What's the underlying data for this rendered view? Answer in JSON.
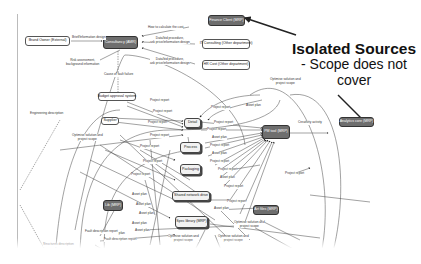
{
  "annotation": {
    "title": "Isolated Sources",
    "subtitle_line1": "- Scope does not",
    "subtitle_line2": "cover"
  },
  "nodes": {
    "brand_owner": "Brand Owner (External)",
    "consultancy": "Consultancy (AMR)",
    "finance_client": "Finance Client (MRP)",
    "it_consulting": "IT Consulting (Other department)",
    "hr_cost": "HR Cost (Other department)",
    "budget_approval": "Budget approval system",
    "supplier": "Supplier",
    "detail": "Detail",
    "process": "Process",
    "packaging": "Packaging",
    "shared_network": "Shared network drive",
    "spec_library": "Spec library (MRP)",
    "pm_tool": "PM tool (MRP)",
    "analytics_engine": "Analytics core (MRP)",
    "lib_db": "Lib (MRP)",
    "art_files": "Art files (MRP)",
    "bottom_node": "Bottom node"
  },
  "edge_labels": {
    "brand_to_consultancy": "Brief/Information design",
    "how_to_calc_cost": "How to calculate the cost",
    "bid_procedure_1_l1": "Data/bid procedure,",
    "bid_procedure_1_l2": "ask price/information design",
    "bid_procedure_2_l1": "Data/bid procedure,",
    "bid_procedure_2_l2": "ask price/information design",
    "risk_assessment_l1": "Risk assessment,",
    "risk_assessment_l2": "background information",
    "cause_of_fault": "Cause of fault failure",
    "engineering_inscription": "Engineering description",
    "optimize_l1": "Optimise solution and",
    "optimize_l2": "project scope",
    "optimize_top_l1": "Optimise solution and",
    "optimize_top_l2": "project scope",
    "creativity_activity": "Creativity activity",
    "project_report": "Project report",
    "asset_plan": "Asset plan",
    "fault_description": "Fault description report",
    "structure_description": "Structures description",
    "opt_bottom_1_l1": "Optimise solution and",
    "opt_bottom_1_l2": "project scope",
    "opt_bottom_2_l1": "Optimise solution and",
    "opt_bottom_2_l2": "project scope",
    "opt_bottom_3_l1": "Optimise solution and",
    "opt_bottom_3_l2": "project scope"
  },
  "colors": {
    "dark_node": "#6e6e6e",
    "edge": "#333333",
    "highlight_arrow": "#222222"
  }
}
